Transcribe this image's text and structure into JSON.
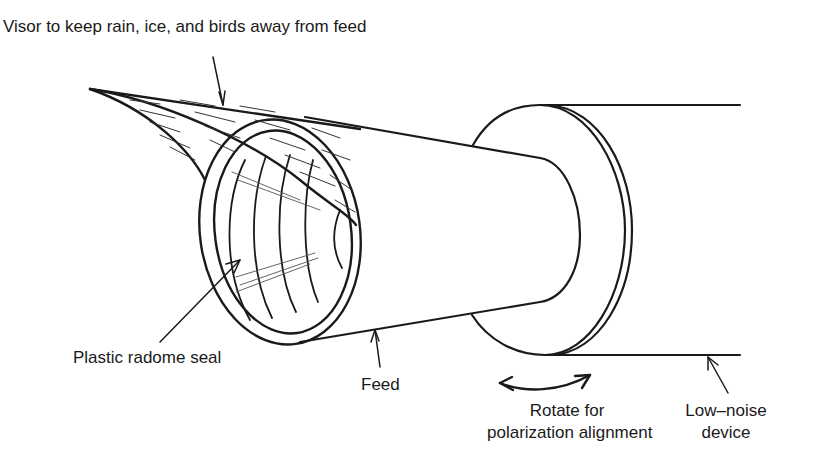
{
  "figure": {
    "type": "line-drawing",
    "colors": {
      "ink": "#1a1a1a",
      "background": "#ffffff"
    }
  },
  "labels": {
    "visor": "Visor to keep rain, ice, and birds away from feed",
    "radome": "Plastic radome seal",
    "feed": "Feed",
    "rotate_line1": "Rotate for",
    "rotate_line2": "polarization alignment",
    "lnd_line1": "Low–noise",
    "lnd_line2": "device"
  }
}
